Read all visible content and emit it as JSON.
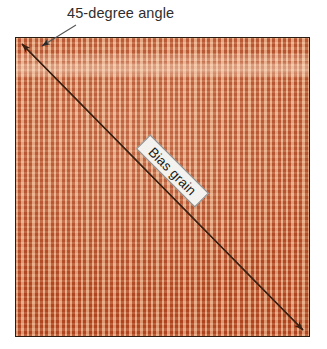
{
  "figure": {
    "type": "fabric-grain-diagram",
    "background_color": "#ffffff",
    "width": 327,
    "height": 349
  },
  "annotations": {
    "angle_label": "45-degree angle",
    "grain_label": "Bias grain"
  },
  "swatch": {
    "name": "woven-fabric-swatch",
    "base_color": "#d9763f",
    "weave_dark_color": "#a63a18",
    "weave_light_color": "#f0ba96",
    "border_color": "#2b1c12"
  },
  "arrow": {
    "name": "bias-grain-arrow",
    "color": "#3a2012",
    "start": [
      22,
      44
    ],
    "end": [
      303,
      330
    ],
    "double_headed": true,
    "angle_degrees": 45
  },
  "leader": {
    "name": "angle-leader-line",
    "color": "#4a4a4a",
    "start": [
      74,
      26
    ],
    "end": [
      41,
      47
    ]
  }
}
